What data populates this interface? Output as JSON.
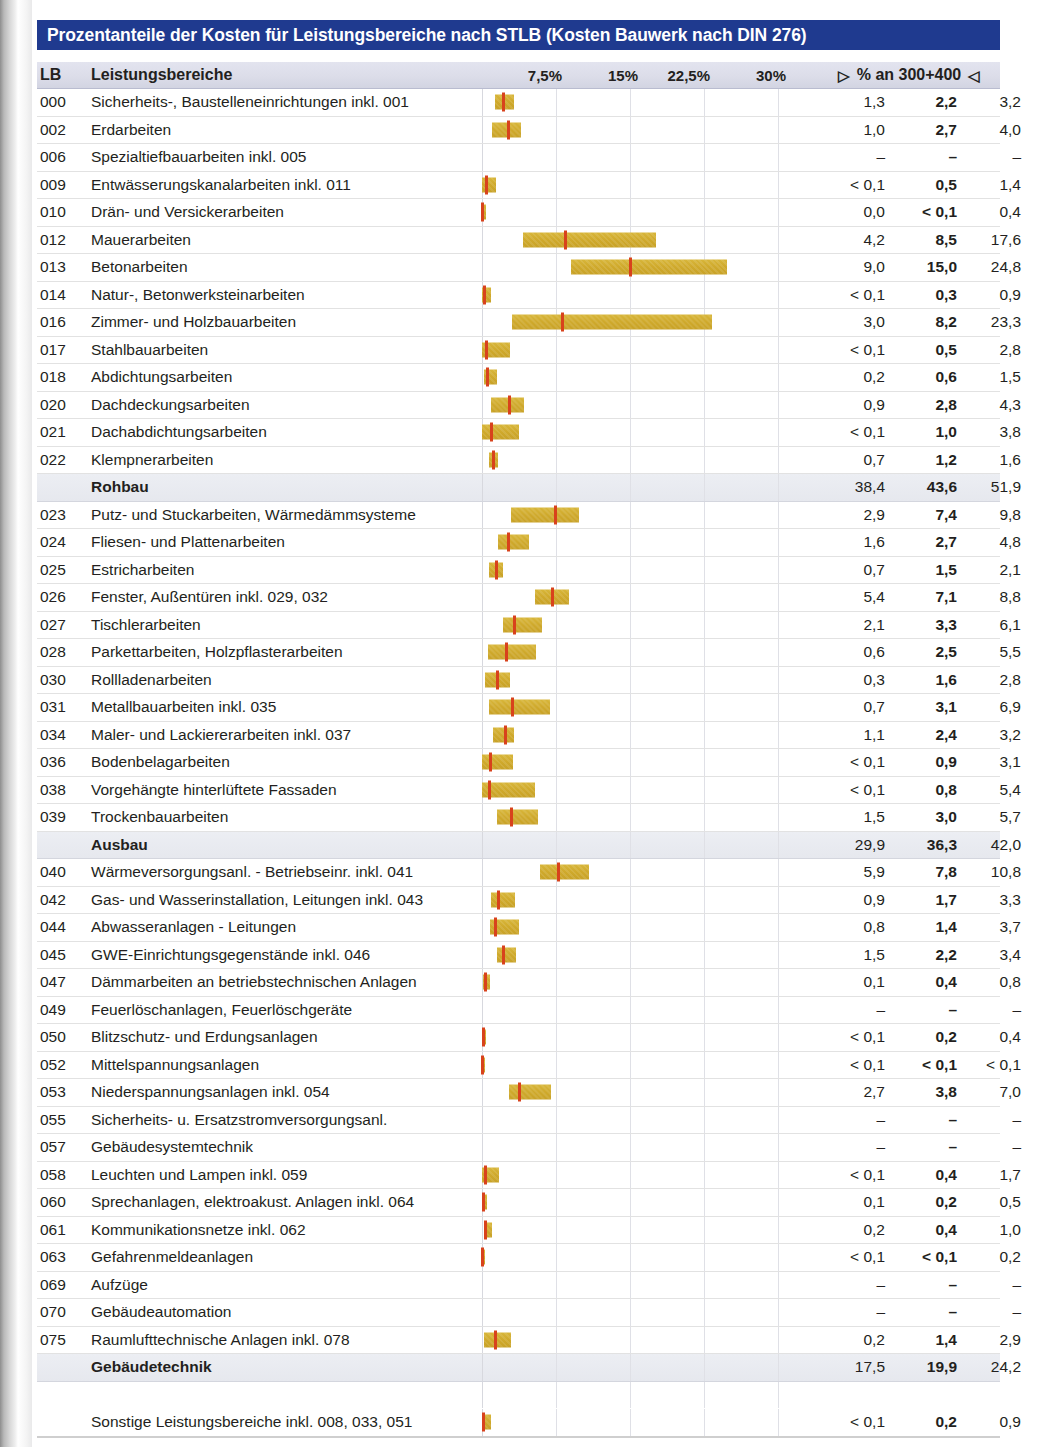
{
  "title": "Prozentanteile der Kosten für Leistungsbereiche nach STLB (Kosten Bauwerk nach DIN 276)",
  "header": {
    "lb": "LB",
    "name": "Leistungsbereiche",
    "axis_ticks": [
      "7,5%",
      "15%",
      "22,5%",
      "30%"
    ],
    "value_header": "% an 300+400",
    "tri_left": "▷",
    "tri_right": "◁"
  },
  "colors": {
    "title_bar": "#1f3a8f",
    "bar_fill": "#cfa92b",
    "median_marker": "#d8421c",
    "header_band": "#dcdde9",
    "group_band": "#e9ebf1"
  },
  "chart_data": {
    "type": "bar",
    "title": "Prozentanteile der Kosten für Leistungsbereiche nach STLB (Kosten Bauwerk nach DIN 276)",
    "xlabel": "% an 300+400",
    "ylabel": "Leistungsbereiche",
    "xlim": [
      0,
      32
    ],
    "xticks": [
      7.5,
      15,
      22.5,
      30
    ],
    "grid": true,
    "legend": "none",
    "note": "Each row is a floating (min-max) bar with a red median marker; columns give min, median (bold), max.",
    "columns": [
      "LB",
      "Leistungsbereiche",
      "min",
      "median",
      "max"
    ],
    "rows": [
      {
        "lb": "000",
        "name": "Sicherheits-, Baustelleneinrichtungen inkl. 001",
        "min": "1,3",
        "mid": "2,2",
        "max": "3,2",
        "bmin": 1.3,
        "bmid": 2.2,
        "bmax": 3.2,
        "group": false
      },
      {
        "lb": "002",
        "name": "Erdarbeiten",
        "min": "1,0",
        "mid": "2,7",
        "max": "4,0",
        "bmin": 1.0,
        "bmid": 2.7,
        "bmax": 4.0,
        "group": false
      },
      {
        "lb": "006",
        "name": "Spezialtiefbauarbeiten inkl. 005",
        "min": "–",
        "mid": "–",
        "max": "–",
        "bmin": null,
        "bmid": null,
        "bmax": null,
        "group": false
      },
      {
        "lb": "009",
        "name": "Entwässerungskanalarbeiten inkl. 011",
        "min": "< 0,1",
        "mid": "0,5",
        "max": "1,4",
        "bmin": 0.05,
        "bmid": 0.5,
        "bmax": 1.4,
        "group": false
      },
      {
        "lb": "010",
        "name": "Drän- und Versickerarbeiten",
        "min": "0,0",
        "mid": "< 0,1",
        "max": "0,4",
        "bmin": 0.0,
        "bmid": 0.08,
        "bmax": 0.4,
        "group": false
      },
      {
        "lb": "012",
        "name": "Mauerarbeiten",
        "min": "4,2",
        "mid": "8,5",
        "max": "17,6",
        "bmin": 4.2,
        "bmid": 8.5,
        "bmax": 17.6,
        "group": false
      },
      {
        "lb": "013",
        "name": "Betonarbeiten",
        "min": "9,0",
        "mid": "15,0",
        "max": "24,8",
        "bmin": 9.0,
        "bmid": 15.0,
        "bmax": 24.8,
        "group": false
      },
      {
        "lb": "014",
        "name": "Natur-, Betonwerksteinarbeiten",
        "min": "< 0,1",
        "mid": "0,3",
        "max": "0,9",
        "bmin": 0.05,
        "bmid": 0.3,
        "bmax": 0.9,
        "group": false
      },
      {
        "lb": "016",
        "name": "Zimmer- und Holzbauarbeiten",
        "min": "3,0",
        "mid": "8,2",
        "max": "23,3",
        "bmin": 3.0,
        "bmid": 8.2,
        "bmax": 23.3,
        "group": false
      },
      {
        "lb": "017",
        "name": "Stahlbauarbeiten",
        "min": "< 0,1",
        "mid": "0,5",
        "max": "2,8",
        "bmin": 0.05,
        "bmid": 0.5,
        "bmax": 2.8,
        "group": false
      },
      {
        "lb": "018",
        "name": "Abdichtungsarbeiten",
        "min": "0,2",
        "mid": "0,6",
        "max": "1,5",
        "bmin": 0.2,
        "bmid": 0.6,
        "bmax": 1.5,
        "group": false
      },
      {
        "lb": "020",
        "name": "Dachdeckungsarbeiten",
        "min": "0,9",
        "mid": "2,8",
        "max": "4,3",
        "bmin": 0.9,
        "bmid": 2.8,
        "bmax": 4.3,
        "group": false
      },
      {
        "lb": "021",
        "name": "Dachabdichtungsarbeiten",
        "min": "< 0,1",
        "mid": "1,0",
        "max": "3,8",
        "bmin": 0.05,
        "bmid": 1.0,
        "bmax": 3.8,
        "group": false
      },
      {
        "lb": "022",
        "name": "Klempnerarbeiten",
        "min": "0,7",
        "mid": "1,2",
        "max": "1,6",
        "bmin": 0.7,
        "bmid": 1.2,
        "bmax": 1.6,
        "group": false
      },
      {
        "lb": "",
        "name": "Rohbau",
        "min": "38,4",
        "mid": "43,6",
        "max": "51,9",
        "bmin": null,
        "bmid": null,
        "bmax": null,
        "group": true
      },
      {
        "lb": "023",
        "name": "Putz- und Stuckarbeiten, Wärmedämmsysteme",
        "min": "2,9",
        "mid": "7,4",
        "max": "9,8",
        "bmin": 2.9,
        "bmid": 7.4,
        "bmax": 9.8,
        "group": false
      },
      {
        "lb": "024",
        "name": "Fliesen- und Plattenarbeiten",
        "min": "1,6",
        "mid": "2,7",
        "max": "4,8",
        "bmin": 1.6,
        "bmid": 2.7,
        "bmax": 4.8,
        "group": false
      },
      {
        "lb": "025",
        "name": "Estricharbeiten",
        "min": "0,7",
        "mid": "1,5",
        "max": "2,1",
        "bmin": 0.7,
        "bmid": 1.5,
        "bmax": 2.1,
        "group": false
      },
      {
        "lb": "026",
        "name": "Fenster, Außentüren inkl. 029, 032",
        "min": "5,4",
        "mid": "7,1",
        "max": "8,8",
        "bmin": 5.4,
        "bmid": 7.1,
        "bmax": 8.8,
        "group": false
      },
      {
        "lb": "027",
        "name": "Tischlerarbeiten",
        "min": "2,1",
        "mid": "3,3",
        "max": "6,1",
        "bmin": 2.1,
        "bmid": 3.3,
        "bmax": 6.1,
        "group": false
      },
      {
        "lb": "028",
        "name": "Parkettarbeiten, Holzpflasterarbeiten",
        "min": "0,6",
        "mid": "2,5",
        "max": "5,5",
        "bmin": 0.6,
        "bmid": 2.5,
        "bmax": 5.5,
        "group": false
      },
      {
        "lb": "030",
        "name": "Rollladenarbeiten",
        "min": "0,3",
        "mid": "1,6",
        "max": "2,8",
        "bmin": 0.3,
        "bmid": 1.6,
        "bmax": 2.8,
        "group": false
      },
      {
        "lb": "031",
        "name": "Metallbauarbeiten inkl. 035",
        "min": "0,7",
        "mid": "3,1",
        "max": "6,9",
        "bmin": 0.7,
        "bmid": 3.1,
        "bmax": 6.9,
        "group": false
      },
      {
        "lb": "034",
        "name": "Maler- und Lackiererarbeiten inkl. 037",
        "min": "1,1",
        "mid": "2,4",
        "max": "3,2",
        "bmin": 1.1,
        "bmid": 2.4,
        "bmax": 3.2,
        "group": false
      },
      {
        "lb": "036",
        "name": "Bodenbelagarbeiten",
        "min": "< 0,1",
        "mid": "0,9",
        "max": "3,1",
        "bmin": 0.05,
        "bmid": 0.9,
        "bmax": 3.1,
        "group": false
      },
      {
        "lb": "038",
        "name": "Vorgehängte hinterlüftete Fassaden",
        "min": "< 0,1",
        "mid": "0,8",
        "max": "5,4",
        "bmin": 0.05,
        "bmid": 0.8,
        "bmax": 5.4,
        "group": false
      },
      {
        "lb": "039",
        "name": "Trockenbauarbeiten",
        "min": "1,5",
        "mid": "3,0",
        "max": "5,7",
        "bmin": 1.5,
        "bmid": 3.0,
        "bmax": 5.7,
        "group": false
      },
      {
        "lb": "",
        "name": "Ausbau",
        "min": "29,9",
        "mid": "36,3",
        "max": "42,0",
        "bmin": null,
        "bmid": null,
        "bmax": null,
        "group": true
      },
      {
        "lb": "040",
        "name": "Wärmeversorgungsanl. - Betriebseinr. inkl. 041",
        "min": "5,9",
        "mid": "7,8",
        "max": "10,8",
        "bmin": 5.9,
        "bmid": 7.8,
        "bmax": 10.8,
        "group": false
      },
      {
        "lb": "042",
        "name": "Gas- und Wasserinstallation, Leitungen inkl. 043",
        "min": "0,9",
        "mid": "1,7",
        "max": "3,3",
        "bmin": 0.9,
        "bmid": 1.7,
        "bmax": 3.3,
        "group": false
      },
      {
        "lb": "044",
        "name": "Abwasseranlagen - Leitungen",
        "min": "0,8",
        "mid": "1,4",
        "max": "3,7",
        "bmin": 0.8,
        "bmid": 1.4,
        "bmax": 3.7,
        "group": false
      },
      {
        "lb": "045",
        "name": "GWE-Einrichtungsgegenstände inkl. 046",
        "min": "1,5",
        "mid": "2,2",
        "max": "3,4",
        "bmin": 1.5,
        "bmid": 2.2,
        "bmax": 3.4,
        "group": false
      },
      {
        "lb": "047",
        "name": "Dämmarbeiten an betriebstechnischen Anlagen",
        "min": "0,1",
        "mid": "0,4",
        "max": "0,8",
        "bmin": 0.1,
        "bmid": 0.4,
        "bmax": 0.8,
        "group": false
      },
      {
        "lb": "049",
        "name": "Feuerlöschanlagen, Feuerlöschgeräte",
        "min": "–",
        "mid": "–",
        "max": "–",
        "bmin": null,
        "bmid": null,
        "bmax": null,
        "group": false
      },
      {
        "lb": "050",
        "name": "Blitzschutz- und Erdungsanlagen",
        "min": "< 0,1",
        "mid": "0,2",
        "max": "0,4",
        "bmin": 0.05,
        "bmid": 0.2,
        "bmax": 0.4,
        "group": false
      },
      {
        "lb": "052",
        "name": "Mittelspannungsanlagen",
        "min": "< 0,1",
        "mid": "< 0,1",
        "max": "< 0,1",
        "bmin": 0.02,
        "bmid": 0.05,
        "bmax": 0.09,
        "group": false
      },
      {
        "lb": "053",
        "name": "Niederspannungsanlagen inkl. 054",
        "min": "2,7",
        "mid": "3,8",
        "max": "7,0",
        "bmin": 2.7,
        "bmid": 3.8,
        "bmax": 7.0,
        "group": false
      },
      {
        "lb": "055",
        "name": "Sicherheits- u. Ersatzstromversorgungsanl.",
        "min": "–",
        "mid": "–",
        "max": "–",
        "bmin": null,
        "bmid": null,
        "bmax": null,
        "group": false
      },
      {
        "lb": "057",
        "name": "Gebäudesystemtechnik",
        "min": "–",
        "mid": "–",
        "max": "–",
        "bmin": null,
        "bmid": null,
        "bmax": null,
        "group": false
      },
      {
        "lb": "058",
        "name": "Leuchten und Lampen inkl. 059",
        "min": "< 0,1",
        "mid": "0,4",
        "max": "1,7",
        "bmin": 0.05,
        "bmid": 0.4,
        "bmax": 1.7,
        "group": false
      },
      {
        "lb": "060",
        "name": "Sprechanlagen, elektroakust. Anlagen inkl. 064",
        "min": "0,1",
        "mid": "0,2",
        "max": "0,5",
        "bmin": 0.1,
        "bmid": 0.2,
        "bmax": 0.5,
        "group": false
      },
      {
        "lb": "061",
        "name": "Kommunikationsnetze inkl. 062",
        "min": "0,2",
        "mid": "0,4",
        "max": "1,0",
        "bmin": 0.2,
        "bmid": 0.4,
        "bmax": 1.0,
        "group": false
      },
      {
        "lb": "063",
        "name": "Gefahrenmeldeanlagen",
        "min": "< 0,1",
        "mid": "< 0,1",
        "max": "0,2",
        "bmin": 0.03,
        "bmid": 0.06,
        "bmax": 0.2,
        "group": false
      },
      {
        "lb": "069",
        "name": "Aufzüge",
        "min": "–",
        "mid": "–",
        "max": "–",
        "bmin": null,
        "bmid": null,
        "bmax": null,
        "group": false
      },
      {
        "lb": "070",
        "name": "Gebäudeautomation",
        "min": "–",
        "mid": "–",
        "max": "–",
        "bmin": null,
        "bmid": null,
        "bmax": null,
        "group": false
      },
      {
        "lb": "075",
        "name": "Raumlufttechnische Anlagen inkl. 078",
        "min": "0,2",
        "mid": "1,4",
        "max": "2,9",
        "bmin": 0.2,
        "bmid": 1.4,
        "bmax": 2.9,
        "group": false
      },
      {
        "lb": "",
        "name": "Gebäudetechnik",
        "min": "17,5",
        "mid": "19,9",
        "max": "24,2",
        "bmin": null,
        "bmid": null,
        "bmax": null,
        "group": true
      },
      {
        "lb": "",
        "name": "",
        "min": "",
        "mid": "",
        "max": "",
        "bmin": null,
        "bmid": null,
        "bmax": null,
        "spacer": true
      },
      {
        "lb": "",
        "name": "Sonstige Leistungsbereiche inkl. 008, 033, 051",
        "min": "< 0,1",
        "mid": "0,2",
        "max": "0,9",
        "bmin": 0.05,
        "bmid": 0.2,
        "bmax": 0.9,
        "group": false
      }
    ]
  }
}
